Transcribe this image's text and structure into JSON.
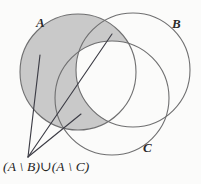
{
  "figure": {
    "kind": "venn-diagram",
    "background_color": "#fbfbfa",
    "stroke_color": "#6f6f70",
    "leader_color": "#3d3d46",
    "shade_color": "#c9c9c9",
    "width": 201,
    "height": 184
  },
  "sets": {
    "A": {
      "label": "A",
      "cx": 78,
      "cy": 72,
      "r": 58,
      "shaded": true
    },
    "B": {
      "label": "B",
      "cx": 133,
      "cy": 70,
      "r": 57,
      "shaded": false
    },
    "C": {
      "label": "C",
      "cx": 112,
      "cy": 98,
      "r": 57,
      "shaded": false
    }
  },
  "expression": {
    "text": "(A \\ B)∪(A \\ C)",
    "description": "union of A minus B and A minus C"
  },
  "leader_lines": [
    {
      "name": "leader-to-upper-left-lune",
      "x1": 28,
      "y1": 157,
      "x2": 40,
      "y2": 55
    },
    {
      "name": "leader-to-lower-lune",
      "x1": 28,
      "y1": 157,
      "x2": 81,
      "y2": 114
    },
    {
      "name": "leader-to-upper-right-lune",
      "x1": 28,
      "y1": 157,
      "x2": 112,
      "y2": 34
    }
  ]
}
